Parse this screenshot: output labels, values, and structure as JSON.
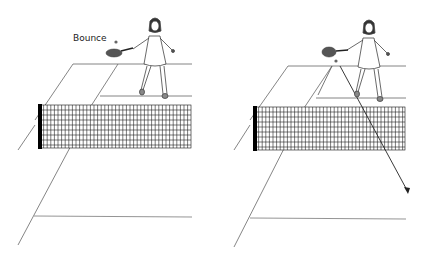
{
  "panels": [
    {
      "id": "left",
      "label": "Bounce",
      "description": "Player hits ball after it bounces near the service line"
    },
    {
      "id": "right",
      "label": "",
      "description": "Ball trajectory shown crossing over the net toward opponent's court"
    }
  ],
  "colors": {
    "line": "#555555",
    "net": "#111111",
    "net_post": "#000000",
    "ball": "#666666",
    "racket": "#555555",
    "arrow": "#222222"
  }
}
